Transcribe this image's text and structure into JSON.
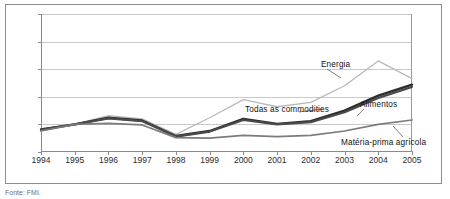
{
  "chart_data": {
    "type": "line",
    "title": "",
    "xlabel": "",
    "ylabel": "",
    "x": [
      1994,
      1995,
      1996,
      1997,
      1998,
      1999,
      2000,
      2001,
      2002,
      2003,
      2004,
      2005
    ],
    "categories": [
      "1994",
      "1995",
      "1996",
      "1997",
      "1998",
      "1999",
      "2000",
      "2001",
      "2002",
      "2003",
      "2004",
      "2005"
    ],
    "xlim": [
      1994,
      2005
    ],
    "ylim": [
      50,
      300
    ],
    "yticks": [
      50,
      100,
      150,
      200,
      250,
      300
    ],
    "grid": "horizontal",
    "legend_position": "inline-annotations",
    "series": [
      {
        "name": "Energia",
        "color": "#b9b9b9",
        "values": [
          92,
          100,
          116,
          110,
          82,
          112,
          145,
          132,
          140,
          170,
          215,
          183
        ]
      },
      {
        "name": "Todas as commodities",
        "color": "#2c2c2c",
        "values": [
          91,
          100,
          112,
          107,
          79,
          88,
          110,
          101,
          106,
          125,
          152,
          172
        ]
      },
      {
        "name": "Alimentos",
        "color": "#4a4a4a",
        "values": [
          90,
          100,
          111,
          106,
          78,
          87,
          108,
          100,
          104,
          122,
          148,
          168
        ]
      },
      {
        "name": "Matéria-prima agrícola",
        "color": "#7c7c7c",
        "values": [
          88,
          100,
          102,
          99,
          76,
          75,
          80,
          78,
          80,
          88,
          100,
          108
        ]
      }
    ],
    "annotations": [
      {
        "label": "Energia",
        "x_px": 321,
        "y_px": 60
      },
      {
        "label": "Todas as commodities",
        "x_px": 245,
        "y_px": 105
      },
      {
        "label": "Alimentos",
        "x_px": 360,
        "y_px": 100
      },
      {
        "label": "Matéria-prima agrícola",
        "x_px": 341,
        "y_px": 138
      }
    ]
  },
  "axis": {
    "y_labels": [
      "300",
      "250",
      "200",
      "150",
      "100",
      "50"
    ],
    "x_labels": [
      "1994",
      "1995",
      "1996",
      "1997",
      "1998",
      "1999",
      "2000",
      "2001",
      "2002",
      "2003",
      "2004",
      "2005"
    ]
  },
  "labels": {
    "energia": "Energia",
    "todas": "Todas as commodities",
    "alimentos": "Alimentos",
    "materia": "Matéria-prima agrícola"
  },
  "caption": {
    "text": "Fonte: FMI."
  }
}
